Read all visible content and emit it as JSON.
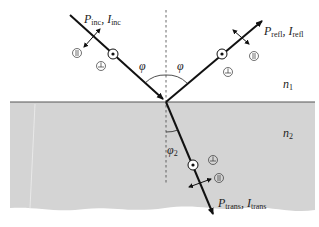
{
  "labels": {
    "incident": {
      "p": "P",
      "p_sub": "inc",
      "sep": ", ",
      "i": "I",
      "i_sub": "inc"
    },
    "reflected": {
      "p": "P",
      "p_sub": "refl",
      "sep": ", ",
      "i": "I",
      "i_sub": "refl"
    },
    "transmitted": {
      "p": "P",
      "p_sub": "trans",
      "sep": ", ",
      "i": "I",
      "i_sub": "trans"
    },
    "n1": {
      "n": "n",
      "sub": "1"
    },
    "n2": {
      "n": "n",
      "sub": "2"
    },
    "phi_left": "φ",
    "phi_right": "φ",
    "phi2": {
      "phi": "φ",
      "sub": "2"
    }
  },
  "colors": {
    "medium2": "#d6d6d6",
    "line": "#111111",
    "interface": "#555555"
  }
}
